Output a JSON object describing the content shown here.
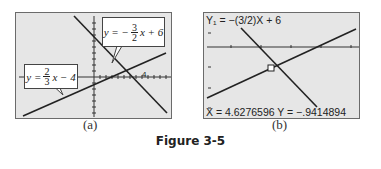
{
  "figure_title": "Figure 3-5",
  "panel_a": {
    "caption": "(a)",
    "eq_top": {
      "prefix": "y = −",
      "num": "3",
      "den": "2",
      "suffix": "x + 6"
    },
    "eq_left": {
      "prefix": "y = ",
      "num": "2",
      "den": "3",
      "suffix": "x − 4"
    },
    "tick_label": "4"
  },
  "panel_b": {
    "caption": "(b)",
    "function_label": "Y₁ = −(3/2)X + 6",
    "trace_readout": "X = 4.6276596   Y = −.9414894",
    "colors": {
      "screen_bg": "#e6e6e6",
      "line": "#2a2a2a"
    }
  }
}
